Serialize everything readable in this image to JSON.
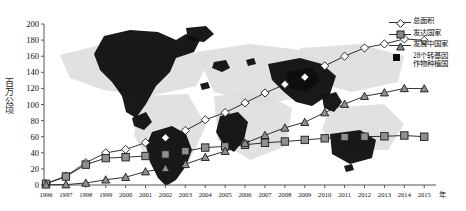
{
  "figure": {
    "ylabel": "百万公顷",
    "xlabel_unit": "年"
  },
  "legend": [
    {
      "label": "总面积",
      "marker": "open-diamond",
      "line": true
    },
    {
      "label": "发达国家",
      "marker": "gray-square",
      "line": true
    },
    {
      "label": "发展中国家",
      "marker": "gray-triangle",
      "line": true
    },
    {
      "label": "28个转基因",
      "label2": "作物种植国",
      "marker": "black-square",
      "line": false
    }
  ],
  "chart_data": {
    "type": "line",
    "title": "",
    "subtitle": "",
    "xlabel": "年",
    "ylabel": "百万公顷",
    "ylim": [
      0,
      200
    ],
    "yticks": [
      0,
      20,
      40,
      60,
      80,
      100,
      120,
      140,
      160,
      180,
      200
    ],
    "grid": false,
    "legend_position": "top-right",
    "background_annotation": "world-map",
    "categories": [
      "1996",
      "1997",
      "1998",
      "1999",
      "2000",
      "2001",
      "2002",
      "2003",
      "2004",
      "2005",
      "2006",
      "2007",
      "2008",
      "2009",
      "2010",
      "2011",
      "2012",
      "2013",
      "2014",
      "2015"
    ],
    "series": [
      {
        "name": "总面积",
        "marker": "open-diamond",
        "values": [
          1.7,
          11.0,
          27.8,
          39.9,
          44.2,
          52.6,
          58.7,
          67.7,
          81.0,
          90.0,
          102.0,
          114.3,
          125.0,
          134.0,
          148.0,
          160.0,
          170.3,
          175.2,
          181.5,
          179.7
        ]
      },
      {
        "name": "发达国家",
        "marker": "gray-square",
        "values": [
          1.5,
          10.5,
          25.3,
          33.4,
          34.5,
          36.0,
          38.0,
          42.0,
          46.5,
          48.0,
          50.0,
          52.5,
          54.0,
          56.0,
          58.0,
          59.5,
          60.0,
          60.5,
          61.5,
          60.0
        ]
      },
      {
        "name": "发展中国家",
        "marker": "gray-triangle",
        "values": [
          0.2,
          0.5,
          2.5,
          6.5,
          9.7,
          16.6,
          20.7,
          25.7,
          34.5,
          42.0,
          52.0,
          61.8,
          71.0,
          78.0,
          90.0,
          100.5,
          110.3,
          114.7,
          120.0,
          119.7
        ]
      }
    ]
  }
}
